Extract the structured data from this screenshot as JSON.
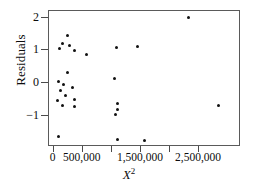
{
  "chart_data": {
    "type": "scatter",
    "title": "",
    "xlabel": "X²",
    "ylabel": "Residuals",
    "xlim": [
      -80000,
      3220000
    ],
    "ylim": [
      -1.95,
      2.2
    ],
    "grid": false,
    "legend": null,
    "xticks": [
      {
        "value": 0,
        "label": "0"
      },
      {
        "value": 500000,
        "label": "500,000"
      },
      {
        "value": 1000000,
        "label": ""
      },
      {
        "value": 1500000,
        "label": "1,500,000"
      },
      {
        "value": 2000000,
        "label": ""
      },
      {
        "value": 2500000,
        "label": "2,500,000"
      }
    ],
    "yticks": [
      {
        "value": 2,
        "label": "2"
      },
      {
        "value": 1,
        "label": "1"
      },
      {
        "value": 0,
        "label": "0"
      },
      {
        "value": -1,
        "label": "−1"
      }
    ],
    "marker": {
      "shape": "circle",
      "color": "#111111",
      "size": 3
    },
    "points": [
      {
        "x": 95000,
        "y": 1.06
      },
      {
        "x": 155000,
        "y": 1.22
      },
      {
        "x": 240000,
        "y": 1.45
      },
      {
        "x": 265000,
        "y": 1.16
      },
      {
        "x": 350000,
        "y": 1.0
      },
      {
        "x": 560000,
        "y": 0.88
      },
      {
        "x": 240000,
        "y": 0.32
      },
      {
        "x": 80000,
        "y": 0.04
      },
      {
        "x": 165000,
        "y": -0.03
      },
      {
        "x": 110000,
        "y": -0.24
      },
      {
        "x": 205000,
        "y": -0.39
      },
      {
        "x": 330000,
        "y": -0.13
      },
      {
        "x": 60000,
        "y": -0.53
      },
      {
        "x": 350000,
        "y": -0.5
      },
      {
        "x": 145000,
        "y": -0.67
      },
      {
        "x": 360000,
        "y": -0.72
      },
      {
        "x": 75000,
        "y": -1.62
      },
      {
        "x": 1040000,
        "y": 0.15
      },
      {
        "x": 1080000,
        "y": 1.1
      },
      {
        "x": 1440000,
        "y": 1.13
      },
      {
        "x": 1105000,
        "y": -0.63
      },
      {
        "x": 1100000,
        "y": -0.82
      },
      {
        "x": 1065000,
        "y": -0.96
      },
      {
        "x": 1100000,
        "y": -1.72
      },
      {
        "x": 1560000,
        "y": -1.74
      },
      {
        "x": 2320000,
        "y": 2.0
      },
      {
        "x": 2830000,
        "y": -0.67
      }
    ]
  }
}
